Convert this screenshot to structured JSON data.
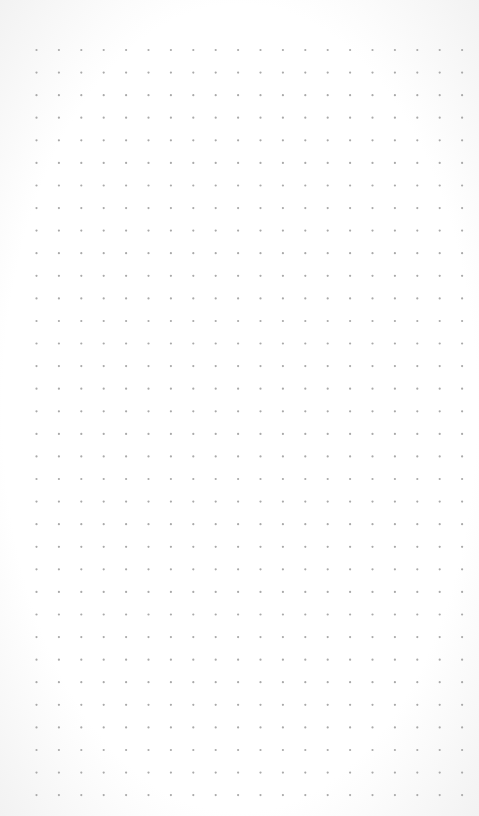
{
  "canvas": {
    "type": "dot-grid",
    "columns": 20,
    "rows": 34,
    "dot_color": "#a9a9a9",
    "background_color": "#ffffff"
  }
}
